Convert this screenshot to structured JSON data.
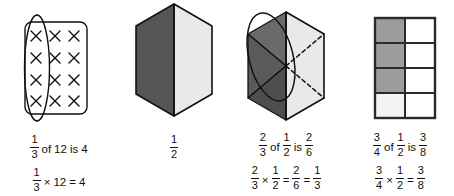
{
  "page": {
    "background_color": "#ffffff",
    "ink_color": "#111111",
    "width": 454,
    "height": 196
  },
  "palette": {
    "dark_gray": "#565656",
    "mid_gray": "#9c9c9c",
    "light_gray": "#e9e9e9",
    "near_white": "#f3f3f3",
    "white": "#ffffff",
    "outline": "#111111"
  },
  "panels": [
    {
      "id": "array-of-twelve",
      "figure": {
        "kind": "x-array",
        "rows": 4,
        "cols": 3,
        "mark": "x-mark",
        "total_marks": 12,
        "circled_group": "first-column",
        "circled_count": 4,
        "fill": "#ffffff"
      },
      "caption": {
        "line1": {
          "fraction_a": {
            "num": "1",
            "den": "3"
          },
          "word1": "of",
          "value1": "12",
          "word2": "is",
          "value2": "4"
        },
        "line2": {
          "fraction_a": {
            "num": "1",
            "den": "3"
          },
          "operator": "×",
          "value1": "12",
          "equals": "=",
          "value2": "4"
        }
      }
    },
    {
      "id": "hexagon-halves",
      "figure": {
        "kind": "hexagon-split",
        "parts": 2,
        "shaded_parts": 1,
        "left_fill": "#565656",
        "right_fill": "#e9e9e9"
      },
      "caption": {
        "line1": {
          "fraction_a": {
            "num": "1",
            "den": "2"
          }
        }
      }
    },
    {
      "id": "hexagon-sixths",
      "figure": {
        "kind": "hexagon-sixths",
        "parts": 6,
        "shaded_parts": 3,
        "circled_parts": 2,
        "left_fill": "#565656",
        "right_fill": "#e9e9e9",
        "dashed_side": "right"
      },
      "caption": {
        "line1": {
          "fraction_a": {
            "num": "2",
            "den": "3"
          },
          "word1": "of",
          "fraction_b": {
            "num": "1",
            "den": "2"
          },
          "word2": "is",
          "fraction_c": {
            "num": "2",
            "den": "6"
          }
        },
        "line2": {
          "fraction_a": {
            "num": "2",
            "den": "3"
          },
          "operator": "×",
          "fraction_b": {
            "num": "1",
            "den": "2"
          },
          "equals1": "=",
          "fraction_c": {
            "num": "2",
            "den": "6"
          },
          "equals2": "=",
          "fraction_d": {
            "num": "1",
            "den": "3"
          }
        }
      }
    },
    {
      "id": "rectangle-eighths",
      "figure": {
        "kind": "grid",
        "rows": 4,
        "cols": 2,
        "shaded_cells": 3,
        "shaded_fill": "#9c9c9c",
        "pale_fill": "#f3f3f3",
        "empty_fill": "#ffffff"
      },
      "caption": {
        "line1": {
          "fraction_a": {
            "num": "3",
            "den": "4"
          },
          "word1": "of",
          "fraction_b": {
            "num": "1",
            "den": "2"
          },
          "word2": "is",
          "fraction_c": {
            "num": "3",
            "den": "8"
          }
        },
        "line2": {
          "fraction_a": {
            "num": "3",
            "den": "4"
          },
          "operator": "×",
          "fraction_b": {
            "num": "1",
            "den": "2"
          },
          "equals1": "=",
          "fraction_c": {
            "num": "3",
            "den": "8"
          }
        }
      }
    }
  ]
}
